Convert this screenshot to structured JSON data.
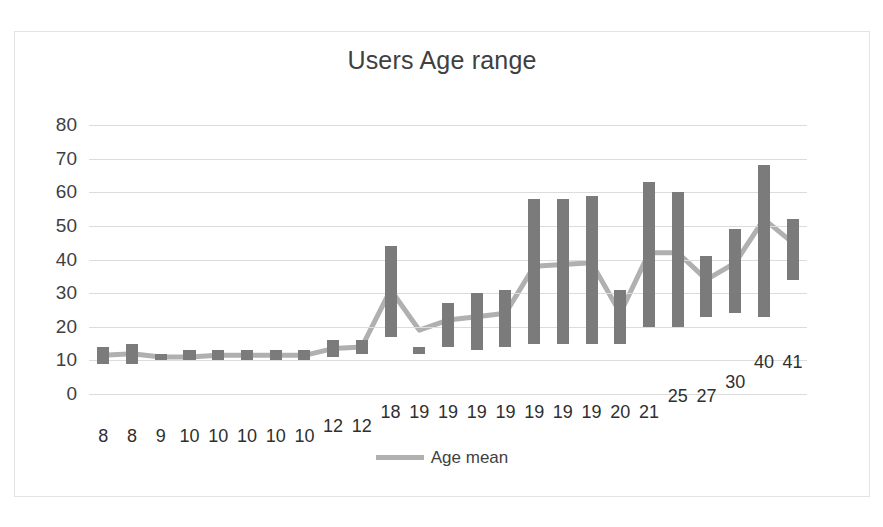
{
  "chart_data": {
    "type": "bar",
    "title": "Users Age range",
    "xlabel": "",
    "ylabel": "",
    "ylim": [
      0,
      80
    ],
    "ytick_step": 10,
    "yticks": [
      0,
      10,
      20,
      30,
      40,
      50,
      60,
      70,
      80
    ],
    "grid": true,
    "legend_position": "bottom",
    "legend": [
      "Age mean"
    ],
    "categories": [
      "8",
      "8",
      "9",
      "10",
      "10",
      "10",
      "10",
      "10",
      "12",
      "12",
      "18",
      "19",
      "19",
      "19",
      "19",
      "19",
      "19",
      "19",
      "20",
      "21",
      "25",
      "27",
      "30",
      "40",
      "41"
    ],
    "series": [
      {
        "name": "Age range",
        "type": "floating-bar",
        "low": [
          9,
          9,
          10,
          10,
          10,
          10,
          10,
          10,
          11,
          12,
          17,
          12,
          14,
          13,
          14,
          15,
          15,
          15,
          15,
          20,
          20,
          23,
          24,
          23,
          34
        ],
        "high": [
          14,
          15,
          12,
          13,
          13,
          13,
          13,
          13,
          16,
          16,
          44,
          14,
          27,
          30,
          31,
          58,
          58,
          59,
          31,
          63,
          60,
          41,
          49,
          68,
          52
        ],
        "color": "#7b7b7b"
      },
      {
        "name": "Age mean",
        "type": "line",
        "values": [
          11.5,
          12,
          11,
          11,
          11.5,
          11.5,
          11.5,
          11.5,
          13.5,
          14,
          31,
          19,
          22,
          23,
          24,
          38,
          38.5,
          39,
          24,
          42,
          42,
          34,
          39,
          52,
          45
        ],
        "color": "#b0b0b0"
      }
    ]
  },
  "legend_label": "Age mean"
}
